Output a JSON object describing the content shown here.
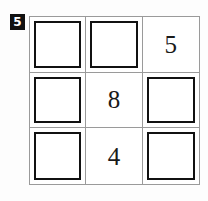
{
  "problem": {
    "badge_label": "5"
  },
  "colors": {
    "page_background": "#fdfdfd",
    "grid_line": "#9a9a9a",
    "answer_box_border": "#111111",
    "badge_background": "#111111",
    "badge_text": "#ffffff",
    "clue_text": "#1a1a1a"
  },
  "grid": {
    "rows": 3,
    "columns": 3,
    "cells": [
      {
        "row": 1,
        "col": 1,
        "type": "answer-box",
        "value": ""
      },
      {
        "row": 1,
        "col": 2,
        "type": "answer-box",
        "value": ""
      },
      {
        "row": 1,
        "col": 3,
        "type": "clue",
        "value": "5"
      },
      {
        "row": 2,
        "col": 1,
        "type": "answer-box",
        "value": ""
      },
      {
        "row": 2,
        "col": 2,
        "type": "clue",
        "value": "8"
      },
      {
        "row": 2,
        "col": 3,
        "type": "answer-box",
        "value": ""
      },
      {
        "row": 3,
        "col": 1,
        "type": "answer-box",
        "value": ""
      },
      {
        "row": 3,
        "col": 2,
        "type": "clue",
        "value": "4"
      },
      {
        "row": 3,
        "col": 3,
        "type": "answer-box",
        "value": ""
      }
    ]
  }
}
